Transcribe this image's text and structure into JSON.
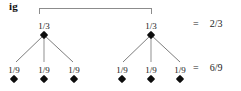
{
  "figure": {
    "tag": "ig",
    "bracket": {
      "name": "span-bracket",
      "color": "#8c8c8c"
    }
  },
  "tree": {
    "level1": {
      "nodes": [
        {
          "label": "1/3",
          "numerator": "1",
          "denominator": "3",
          "x": 44,
          "y": 21
        },
        {
          "label": "1/3",
          "numerator": "1",
          "denominator": "3",
          "x": 151,
          "y": 21
        }
      ]
    },
    "level2": {
      "nodes": [
        {
          "label": "1/9",
          "numerator": "1",
          "denominator": "9",
          "x": 14,
          "y": 65
        },
        {
          "label": "1/9",
          "numerator": "1",
          "denominator": "9",
          "x": 44,
          "y": 65
        },
        {
          "label": "1/9",
          "numerator": "1",
          "denominator": "9",
          "x": 74,
          "y": 65
        },
        {
          "label": "1/9",
          "numerator": "1",
          "denominator": "9",
          "x": 122,
          "y": 65
        },
        {
          "label": "1/9",
          "numerator": "1",
          "denominator": "9",
          "x": 151,
          "y": 65
        },
        {
          "label": "1/9",
          "numerator": "1",
          "denominator": "9",
          "x": 180,
          "y": 65
        }
      ]
    },
    "edge_color": "#6e6e6e"
  },
  "equations": [
    {
      "sign": "=",
      "value": "2/3",
      "numerator": "2",
      "denominator": "3",
      "y": 18
    },
    {
      "sign": "=",
      "value": "6/9",
      "numerator": "6",
      "denominator": "9",
      "y": 62
    }
  ],
  "colors": {
    "marker": "#0d0d0d",
    "text": "#1a1a1a",
    "bracket": "#8c8c8c",
    "background": "#ffffff"
  }
}
